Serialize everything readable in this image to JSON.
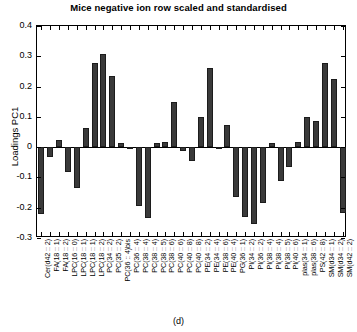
{
  "figure": {
    "panel_letter": "(d)"
  },
  "chart_data": {
    "type": "bar",
    "title": "Mice negative ion row scaled and standardised",
    "xlabel": "",
    "ylabel": "Loadings PC1",
    "ylim": [
      -0.3,
      0.4
    ],
    "ytick_values": [
      0.4,
      0.3,
      0.2,
      0.1,
      0,
      -0.1,
      -0.2,
      -0.3
    ],
    "ytick_labels": [
      "0.4",
      "0.3",
      "0.2",
      "0.1",
      "0",
      "-0.1",
      "-0.2",
      "-0.3"
    ],
    "grid": false,
    "legend": null,
    "bar_color": "#3a3a3a",
    "categories": [
      "Cer(d42 :: 2)",
      "FA(18 :: 1)",
      "FA(18 :: 2)",
      "LPC(16 :: 0)",
      "LPC(18 :: 1)",
      "LPC(18 :: 1)",
      "LPC(18 :: 2)",
      "PC(34 :: 2)",
      "PC(35 :: 2)",
      "PC(36 :: 4)bis",
      "PC(36 :: 4)",
      "PC(38 :: 4)",
      "PC(38 :: 4)",
      "PC(38 :: 5)",
      "PC(38 :: 6)",
      "PC(40 :: 6)",
      "PC(40 :: 8)",
      "PC(40 :: 8)",
      "PE(34 :: 2)",
      "PE(34 :: 4)",
      "PE(38 :: 6)",
      "PE(40 :: 4)",
      "PG(36 :: 1)",
      "PI(34 :: 2)",
      "PI(36 :: 2)",
      "PI(38 :: 4)",
      "PI(38 :: 4)",
      "PI(38 :: 5)",
      "PI(40 :: 6)",
      "plas(34 :: 1)",
      "plas(38 :: 6)",
      "PS(42 :: 8)",
      "SM(d34 :: 1)",
      "SM(d34 :: 2)",
      "SM(d42 :: 2)"
    ],
    "values": [
      -0.221,
      -0.031,
      0.022,
      -0.083,
      -0.136,
      0.062,
      0.278,
      0.306,
      0.234,
      0.015,
      -0.002,
      -0.194,
      -0.233,
      0.014,
      0.017,
      0.148,
      -0.013,
      -0.045,
      0.098,
      0.262,
      -0.004,
      0.072,
      -0.165,
      -0.232,
      -0.253,
      -0.184,
      0.013,
      -0.113,
      -0.064,
      0.018,
      0.1,
      0.087,
      0.277,
      0.226,
      -0.216
    ]
  }
}
